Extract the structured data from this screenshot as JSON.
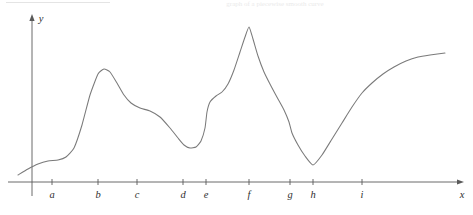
{
  "figure": {
    "background_color": "#ffffff",
    "curve_color": "#7a7a7a",
    "axis_color": "#5a5a5a",
    "label_color": "#2f2f2f",
    "caption_faint": "graph of a piecewise smooth curve"
  },
  "axes": {
    "x_axis_label": "x",
    "y_axis_label": "y",
    "x_axis_y_px": 182,
    "y_axis_x_px": 32,
    "x_axis_start_px": 8,
    "x_axis_end_px": 464,
    "y_axis_top_px": 14,
    "y_axis_bottom_px": 196
  },
  "ticks": [
    {
      "label": "a",
      "x_px": 52
    },
    {
      "label": "b",
      "x_px": 98
    },
    {
      "label": "c",
      "x_px": 137
    },
    {
      "label": "d",
      "x_px": 183
    },
    {
      "label": "e",
      "x_px": 206
    },
    {
      "label": "f",
      "x_px": 249
    },
    {
      "label": "g",
      "x_px": 290
    },
    {
      "label": "h",
      "x_px": 313
    },
    {
      "label": "i",
      "x_px": 362
    }
  ],
  "chart_data": {
    "type": "line",
    "title": "",
    "subtitle": "",
    "xlabel": "x",
    "ylabel": "y",
    "grid": false,
    "legend": "none",
    "xlim": [
      8,
      464
    ],
    "ylim": [
      14,
      196
    ],
    "series": [
      {
        "name": "curve",
        "description": "Single continuous curve with smooth maxima/minima, cusps, corners and a vertical tangent; y measured downward in pixels (smaller y = higher on plot).",
        "points_px": [
          [
            18,
            175
          ],
          [
            28,
            169
          ],
          [
            38,
            164
          ],
          [
            48,
            161
          ],
          [
            58,
            160
          ],
          [
            66,
            157
          ],
          [
            74,
            148
          ],
          [
            82,
            125
          ],
          [
            90,
            95
          ],
          [
            98,
            74
          ],
          [
            104,
            69
          ],
          [
            110,
            72
          ],
          [
            117,
            83
          ],
          [
            124,
            95
          ],
          [
            131,
            103
          ],
          [
            140,
            108
          ],
          [
            150,
            111
          ],
          [
            160,
            117
          ],
          [
            170,
            128
          ],
          [
            178,
            138
          ],
          [
            184,
            145
          ],
          [
            190,
            148
          ],
          [
            196,
            147
          ],
          [
            201,
            141
          ],
          [
            205,
            128
          ],
          [
            207,
            112
          ],
          [
            210,
            102
          ],
          [
            216,
            96
          ],
          [
            222,
            92
          ],
          [
            228,
            84
          ],
          [
            234,
            70
          ],
          [
            240,
            52
          ],
          [
            245,
            37
          ],
          [
            249,
            27
          ],
          [
            253,
            39
          ],
          [
            258,
            56
          ],
          [
            264,
            72
          ],
          [
            271,
            86
          ],
          [
            278,
            99
          ],
          [
            284,
            110
          ],
          [
            289,
            122
          ],
          [
            292,
            133
          ],
          [
            298,
            145
          ],
          [
            305,
            156
          ],
          [
            313,
            165
          ],
          [
            322,
            155
          ],
          [
            332,
            139
          ],
          [
            342,
            123
          ],
          [
            352,
            107
          ],
          [
            362,
            93
          ],
          [
            372,
            83
          ],
          [
            383,
            74
          ],
          [
            394,
            67
          ],
          [
            406,
            61
          ],
          [
            418,
            57
          ],
          [
            430,
            55
          ],
          [
            445,
            53
          ]
        ],
        "features": [
          {
            "at": "a",
            "type": "inflection-plateau",
            "note": "nearly flat shoulder, curve rising slowly"
          },
          {
            "at": "b",
            "type": "smooth-local-maximum",
            "note": "rounded peak"
          },
          {
            "at": "c",
            "type": "inflection",
            "note": "shallow decreasing shoulder"
          },
          {
            "at": "d",
            "type": "smooth-local-minimum",
            "note": "rounded valley"
          },
          {
            "at": "e",
            "type": "vertical-tangent",
            "note": "steep near-vertical rise"
          },
          {
            "at": "f",
            "type": "cusp-maximum",
            "note": "sharp corner at global maximum"
          },
          {
            "at": "g",
            "type": "corner",
            "note": "abrupt slope change, still decreasing"
          },
          {
            "at": "h",
            "type": "corner-minimum",
            "note": "V-shaped global minimum"
          },
          {
            "at": "i",
            "type": "corner",
            "note": "slope decreases, curve becomes concave down"
          }
        ]
      }
    ]
  }
}
